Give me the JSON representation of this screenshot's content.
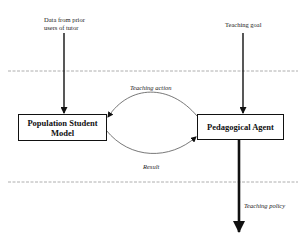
{
  "diagram": {
    "inputs": {
      "left": "Data from prior users of tutor",
      "right": "Teaching goal"
    },
    "nodes": {
      "student_model": "Population Student Model",
      "agent": "Pedagogical Agent"
    },
    "edges": {
      "top": "Teaching action",
      "bottom": "Result"
    },
    "output": "Teaching policy"
  }
}
